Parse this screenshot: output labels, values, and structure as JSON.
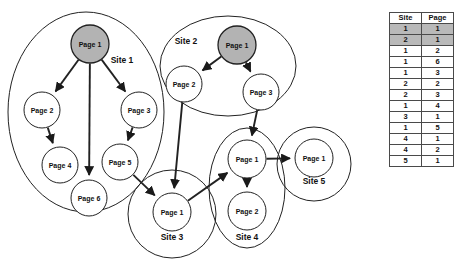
{
  "diagram": {
    "type": "site-page-link-graph",
    "background": "#ffffff",
    "highlight_fill": "#b3b3b3",
    "node_fill": "#ffffff",
    "stroke": "#222222",
    "sites": [
      {
        "id": "site1",
        "label": "Site 1",
        "label_x": 122,
        "label_y": 63,
        "shape": "ellipse",
        "cx": 86,
        "cy": 112,
        "rx": 78,
        "ry": 100,
        "nodes": [
          {
            "id": "s1p1",
            "label": "Page 1",
            "cx": 90,
            "cy": 44,
            "r": 19,
            "highlighted": true
          },
          {
            "id": "s1p2",
            "label": "Page 2",
            "cx": 42,
            "cy": 110,
            "r": 18,
            "highlighted": false
          },
          {
            "id": "s1p3",
            "label": "Page 3",
            "cx": 139,
            "cy": 110,
            "r": 18,
            "highlighted": false
          },
          {
            "id": "s1p4",
            "label": "Page 4",
            "cx": 60,
            "cy": 165,
            "r": 18,
            "highlighted": false
          },
          {
            "id": "s1p5",
            "label": "Page 5",
            "cx": 120,
            "cy": 162,
            "r": 18,
            "highlighted": false
          },
          {
            "id": "s1p6",
            "label": "Page 6",
            "cx": 89,
            "cy": 198,
            "r": 18,
            "highlighted": false
          }
        ]
      },
      {
        "id": "site2",
        "label": "Site 2",
        "label_x": 186,
        "label_y": 44,
        "shape": "ellipse",
        "cx": 228,
        "cy": 66,
        "rx": 68,
        "ry": 50,
        "nodes": [
          {
            "id": "s2p1",
            "label": "Page 1",
            "cx": 237,
            "cy": 45,
            "r": 19,
            "highlighted": true
          },
          {
            "id": "s2p2",
            "label": "Page 2",
            "cx": 184,
            "cy": 84,
            "r": 18,
            "highlighted": false
          },
          {
            "id": "s2p3",
            "label": "Page 3",
            "cx": 261,
            "cy": 92,
            "r": 18,
            "highlighted": false
          }
        ]
      },
      {
        "id": "site3",
        "label": "Site 3",
        "label_x": 172,
        "label_y": 240,
        "shape": "ellipse",
        "cx": 172,
        "cy": 214,
        "rx": 44,
        "ry": 44,
        "nodes": [
          {
            "id": "s3p1",
            "label": "Page 1",
            "cx": 172,
            "cy": 212,
            "r": 19,
            "highlighted": false
          }
        ]
      },
      {
        "id": "site4",
        "label": "Site 4",
        "label_x": 247,
        "label_y": 240,
        "shape": "ellipse",
        "cx": 247,
        "cy": 188,
        "rx": 38,
        "ry": 60,
        "nodes": [
          {
            "id": "s4p1",
            "label": "Page 1",
            "cx": 247,
            "cy": 159,
            "r": 19,
            "highlighted": false
          },
          {
            "id": "s4p2",
            "label": "Page 2",
            "cx": 247,
            "cy": 211,
            "r": 19,
            "highlighted": false
          }
        ]
      },
      {
        "id": "site5",
        "label": "Site 5",
        "label_x": 314,
        "label_y": 184,
        "shape": "ellipse",
        "cx": 314,
        "cy": 164,
        "rx": 37,
        "ry": 37,
        "nodes": [
          {
            "id": "s5p1",
            "label": "Page 1",
            "cx": 314,
            "cy": 158,
            "r": 19,
            "highlighted": false
          }
        ]
      }
    ],
    "edges": [
      {
        "from": "s1p1",
        "to": "s1p2"
      },
      {
        "from": "s1p1",
        "to": "s1p3"
      },
      {
        "from": "s1p1",
        "to": "s1p6"
      },
      {
        "from": "s1p2",
        "to": "s1p4"
      },
      {
        "from": "s1p3",
        "to": "s1p5"
      },
      {
        "from": "s1p5",
        "to": "s3p1"
      },
      {
        "from": "s2p1",
        "to": "s2p2"
      },
      {
        "from": "s2p1",
        "to": "s2p3"
      },
      {
        "from": "s2p2",
        "to": "s3p1"
      },
      {
        "from": "s2p3",
        "to": "s4p1"
      },
      {
        "from": "s3p1",
        "to": "s4p1"
      },
      {
        "from": "s4p1",
        "to": "s4p2"
      },
      {
        "from": "s4p1",
        "to": "s5p1"
      }
    ]
  },
  "table": {
    "name": "site-page-table",
    "headers": [
      "Site",
      "Page"
    ],
    "rows": [
      {
        "site": "1",
        "page": "1",
        "highlighted": true
      },
      {
        "site": "2",
        "page": "1",
        "highlighted": true
      },
      {
        "site": "1",
        "page": "2",
        "highlighted": false
      },
      {
        "site": "1",
        "page": "6",
        "highlighted": false
      },
      {
        "site": "1",
        "page": "3",
        "highlighted": false
      },
      {
        "site": "2",
        "page": "2",
        "highlighted": false
      },
      {
        "site": "2",
        "page": "3",
        "highlighted": false
      },
      {
        "site": "1",
        "page": "4",
        "highlighted": false
      },
      {
        "site": "3",
        "page": "1",
        "highlighted": false
      },
      {
        "site": "1",
        "page": "5",
        "highlighted": false
      },
      {
        "site": "4",
        "page": "1",
        "highlighted": false
      },
      {
        "site": "4",
        "page": "2",
        "highlighted": false
      },
      {
        "site": "5",
        "page": "1",
        "highlighted": false
      }
    ]
  }
}
